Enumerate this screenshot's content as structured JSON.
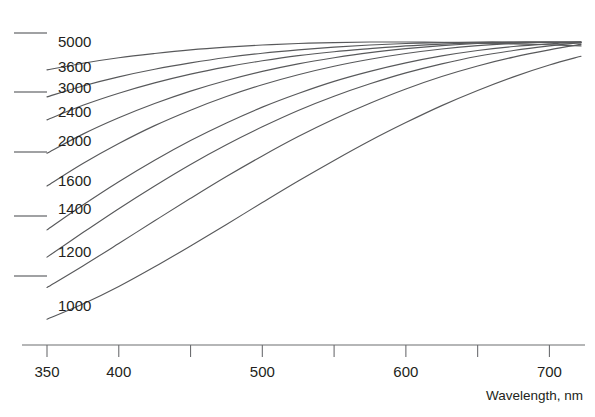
{
  "chart_data": {
    "type": "line",
    "title": "",
    "subtitle": "",
    "xlabel": "Wavelength, nm",
    "ylabel": "",
    "xlim": [
      350,
      722
    ],
    "ylim": [
      0,
      1.05
    ],
    "grid": false,
    "legend": "inline-left-labels",
    "x_ticks_major": [
      350,
      400,
      500,
      600,
      700
    ],
    "x_tick_labels": [
      "350",
      "400",
      "500",
      "600",
      "700"
    ],
    "x_ticks_minor": [
      450,
      550,
      650
    ],
    "y_tick_positions_px": [
      33,
      92,
      152,
      216,
      276
    ],
    "y_tick_labels": [
      "",
      "",
      "",
      "",
      ""
    ],
    "x": [
      350,
      375,
      400,
      425,
      450,
      475,
      500,
      525,
      550,
      575,
      600,
      625,
      650,
      675,
      700,
      722
    ],
    "series": [
      {
        "name": "5000",
        "label": "5000",
        "color": "#58595b",
        "values": [
          0.908,
          0.93,
          0.948,
          0.962,
          0.974,
          0.983,
          0.99,
          0.995,
          0.998,
          1.0,
          1.0,
          0.999,
          0.997,
          0.994,
          0.991,
          0.987
        ]
      },
      {
        "name": "3600",
        "label": "3600",
        "color": "#58595b",
        "values": [
          0.819,
          0.855,
          0.885,
          0.91,
          0.931,
          0.949,
          0.963,
          0.974,
          0.983,
          0.99,
          0.995,
          0.998,
          1.0,
          1.0,
          0.999,
          0.997
        ]
      },
      {
        "name": "3000",
        "label": "3000",
        "color": "#58595b",
        "values": [
          0.743,
          0.791,
          0.831,
          0.865,
          0.894,
          0.918,
          0.938,
          0.955,
          0.968,
          0.978,
          0.987,
          0.993,
          0.997,
          0.999,
          1.0,
          1.0
        ]
      },
      {
        "name": "2400",
        "label": "2400",
        "color": "#58595b",
        "values": [
          0.633,
          0.696,
          0.75,
          0.797,
          0.838,
          0.873,
          0.903,
          0.928,
          0.948,
          0.965,
          0.978,
          0.988,
          0.995,
          0.999,
          1.0,
          1.0
        ]
      },
      {
        "name": "2000",
        "label": "2000",
        "color": "#58595b",
        "values": [
          0.525,
          0.599,
          0.665,
          0.724,
          0.775,
          0.82,
          0.859,
          0.892,
          0.92,
          0.943,
          0.962,
          0.977,
          0.988,
          0.995,
          0.999,
          1.0
        ]
      },
      {
        "name": "1600",
        "label": "1600",
        "color": "#58595b",
        "values": [
          0.38,
          0.462,
          0.539,
          0.61,
          0.675,
          0.733,
          0.785,
          0.83,
          0.87,
          0.903,
          0.931,
          0.954,
          0.972,
          0.985,
          0.994,
          1.0
        ]
      },
      {
        "name": "1400",
        "label": "1400",
        "color": "#58595b",
        "values": [
          0.29,
          0.371,
          0.45,
          0.525,
          0.596,
          0.661,
          0.72,
          0.774,
          0.821,
          0.862,
          0.898,
          0.928,
          0.953,
          0.972,
          0.987,
          0.998
        ]
      },
      {
        "name": "1200",
        "label": "1200",
        "color": "#58595b",
        "values": [
          0.19,
          0.261,
          0.335,
          0.41,
          0.484,
          0.556,
          0.624,
          0.688,
          0.746,
          0.798,
          0.845,
          0.886,
          0.921,
          0.95,
          0.974,
          0.992
        ]
      },
      {
        "name": "1000",
        "label": "1000",
        "color": "#58595b",
        "values": [
          0.085,
          0.135,
          0.193,
          0.258,
          0.327,
          0.398,
          0.47,
          0.541,
          0.609,
          0.674,
          0.734,
          0.79,
          0.84,
          0.885,
          0.924,
          0.953
        ]
      }
    ],
    "curve_label_positions": [
      {
        "label": "5000",
        "x_px": 58,
        "y_px": 47
      },
      {
        "label": "3600",
        "x_px": 58,
        "y_px": 72
      },
      {
        "label": "3000",
        "x_px": 58,
        "y_px": 93
      },
      {
        "label": "2400",
        "x_px": 58,
        "y_px": 117
      },
      {
        "label": "2000",
        "x_px": 58,
        "y_px": 146
      },
      {
        "label": "1600",
        "x_px": 58,
        "y_px": 186
      },
      {
        "label": "1400",
        "x_px": 58,
        "y_px": 214
      },
      {
        "label": "1200",
        "x_px": 58,
        "y_px": 257
      },
      {
        "label": "1000",
        "x_px": 58,
        "y_px": 311
      }
    ],
    "colors": {
      "curve": "#58595b",
      "axis": "#6d6e71",
      "text": "#231f20",
      "background": "#ffffff"
    }
  }
}
